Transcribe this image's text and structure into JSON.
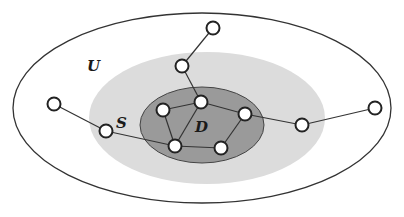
{
  "labels": {
    "universe": "U",
    "seed": "S",
    "dense": "D"
  },
  "colors": {
    "background": "#ffffff",
    "outer_stroke": "#333333",
    "region_s_fill": "#dcdcdc",
    "region_d_fill": "#9a9a9a",
    "region_d_stroke": "#444444",
    "edge": "#333333",
    "node_fill": "#ffffff",
    "node_stroke": "#222222"
  },
  "regions": [
    {
      "name": "U",
      "cx": 202,
      "cy": 108,
      "rx": 189,
      "ry": 95
    },
    {
      "name": "S",
      "cx": 207,
      "cy": 118,
      "rx": 118,
      "ry": 66
    },
    {
      "name": "D",
      "cx": 202,
      "cy": 125,
      "rx": 62,
      "ry": 38
    }
  ],
  "nodes": [
    {
      "id": "n1",
      "x": 213,
      "y": 28
    },
    {
      "id": "n2",
      "x": 182,
      "y": 66
    },
    {
      "id": "n3",
      "x": 163,
      "y": 110
    },
    {
      "id": "n4",
      "x": 201,
      "y": 102
    },
    {
      "id": "n5",
      "x": 245,
      "y": 114
    },
    {
      "id": "n6",
      "x": 175,
      "y": 146
    },
    {
      "id": "n7",
      "x": 221,
      "y": 148
    },
    {
      "id": "n8",
      "x": 54,
      "y": 104
    },
    {
      "id": "n9",
      "x": 106,
      "y": 131
    },
    {
      "id": "n10",
      "x": 302,
      "y": 125
    },
    {
      "id": "n11",
      "x": 375,
      "y": 108
    }
  ],
  "edges": [
    [
      "n1",
      "n2"
    ],
    [
      "n2",
      "n4"
    ],
    [
      "n3",
      "n4"
    ],
    [
      "n4",
      "n5"
    ],
    [
      "n4",
      "n6"
    ],
    [
      "n3",
      "n6"
    ],
    [
      "n6",
      "n7"
    ],
    [
      "n7",
      "n5"
    ],
    [
      "n8",
      "n9"
    ],
    [
      "n9",
      "n6"
    ],
    [
      "n5",
      "n10"
    ],
    [
      "n10",
      "n11"
    ]
  ]
}
